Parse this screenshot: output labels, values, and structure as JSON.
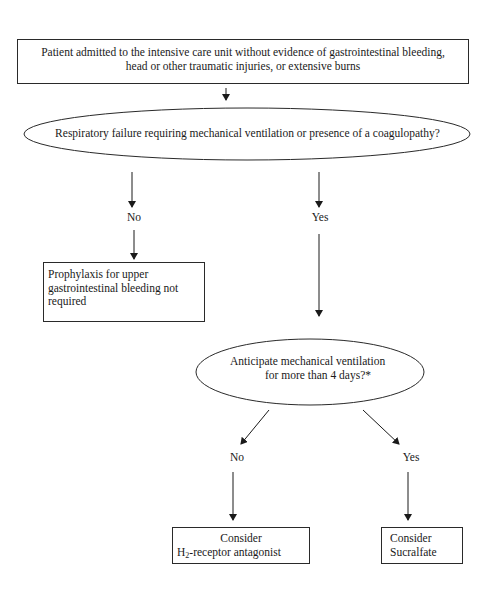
{
  "diagram": {
    "start_box": {
      "line1": "Patient admitted to the intensive care unit without evidence of gastrointestinal bleeding,",
      "line2": "head or other traumatic injuries, or extensive burns"
    },
    "decision1": {
      "text": "Respiratory failure requiring mechanical ventilation or presence of a coagulopathy?"
    },
    "decision1_no_label": "No",
    "decision1_yes_label": "Yes",
    "no_prophylaxis_box": {
      "line1": "Prophylaxis for upper",
      "line2": "gastrointestinal bleeding not",
      "line3": "required"
    },
    "decision2": {
      "line1": "Anticipate mechanical ventilation",
      "line2": "for more than 4 days?*"
    },
    "decision2_no_label": "No",
    "decision2_yes_label": "Yes",
    "h2_box": {
      "line1": "Consider",
      "line2_prefix": "H",
      "line2_sub": "2",
      "line2_suffix": "-receptor antagonist"
    },
    "sucralfate_box": {
      "line1": "Consider",
      "line2": "Sucralfate"
    }
  },
  "colors": {
    "stroke": "#2a2a2a",
    "text": "#1a1a1a",
    "background": "#ffffff"
  }
}
